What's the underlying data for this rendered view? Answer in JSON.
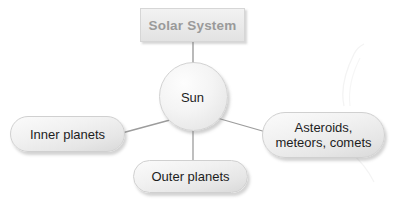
{
  "diagram": {
    "title_box": {
      "label": "Solar System",
      "text_color": "#9a9a9a",
      "fill_color": "#ebebeb"
    },
    "center_node": {
      "label": "Sun",
      "shape": "circle",
      "fill_color": "#f2f2f2",
      "text_color": "#1d1d1d"
    },
    "branch_nodes": [
      {
        "id": "inner-planets",
        "label": "Inner planets",
        "shape": "rounded-pill",
        "position": "left"
      },
      {
        "id": "outer-planets",
        "label": "Outer planets",
        "shape": "rounded-pill",
        "position": "bottom"
      },
      {
        "id": "asteroids-meteors-comets",
        "label": "Asteroids,\nmeteors, comets",
        "shape": "rounded-pill",
        "position": "right"
      }
    ],
    "connectors": [
      {
        "id": "title-to-sun",
        "from": "Solar System",
        "to": "Sun",
        "style": "straight-vertical"
      },
      {
        "id": "sun-to-inner",
        "from": "Sun",
        "to": "Inner planets",
        "style": "straight-diagonal"
      },
      {
        "id": "sun-to-outer",
        "from": "Sun",
        "to": "Outer planets",
        "style": "straight-vertical"
      },
      {
        "id": "sun-to-asteroids",
        "from": "Sun",
        "to": "Asteroids, meteors, comets",
        "style": "straight-diagonal"
      }
    ],
    "colors": {
      "background": "#ffffff",
      "connector_line": "#9c9c9c",
      "node_border": "#d0d0d0",
      "shadow": "rgba(120,120,120,0.33)"
    }
  }
}
